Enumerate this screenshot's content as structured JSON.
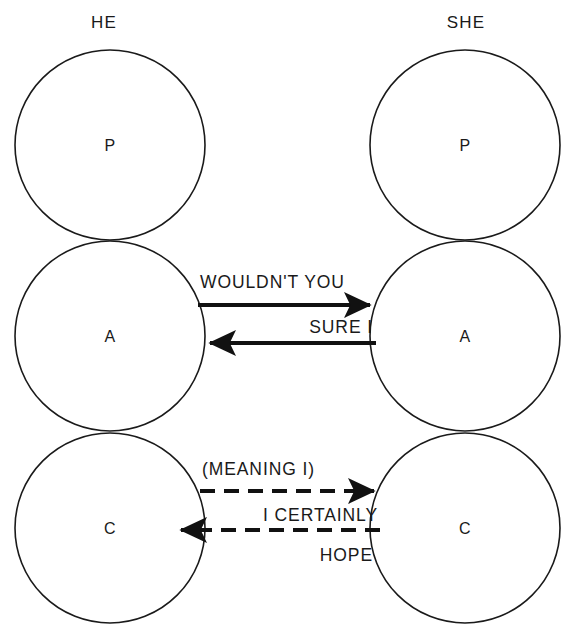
{
  "diagram": {
    "background_color": "#ffffff",
    "line_color": "#111111",
    "text_color": "#1a1a1a",
    "columns": [
      {
        "header": "HE",
        "header_x": 104,
        "header_y": 28,
        "center_x": 110,
        "ego_states": [
          {
            "letter": "P",
            "center_y": 145
          },
          {
            "letter": "A",
            "center_y": 336
          },
          {
            "letter": "C",
            "center_y": 528
          }
        ]
      },
      {
        "header": "SHE",
        "header_x": 466,
        "header_y": 28,
        "center_x": 465,
        "ego_states": [
          {
            "letter": "P",
            "center_y": 145
          },
          {
            "letter": "A",
            "center_y": 336
          },
          {
            "letter": "C",
            "center_y": 528
          }
        ]
      }
    ],
    "circle_radius": 95,
    "transactions": [
      {
        "label": "WOULDN'T YOU",
        "style": "solid",
        "direction": "right",
        "from": "he-adult",
        "to": "she-adult",
        "line_y": 305,
        "x_start": 198,
        "x_end": 374,
        "label_x": 200,
        "label_y": 288,
        "label_align": "start"
      },
      {
        "label": "SURE I",
        "style": "solid",
        "direction": "left",
        "from": "she-adult",
        "to": "he-adult",
        "line_y": 343,
        "x_start": 376,
        "x_end": 206,
        "label_x": 373,
        "label_y": 333,
        "label_align": "end"
      },
      {
        "label": "(MEANING I)",
        "style": "dashed",
        "direction": "right",
        "from": "he-child",
        "to": "she-child",
        "line_y": 491,
        "x_start": 200,
        "x_end": 378,
        "label_x": 202,
        "label_y": 475,
        "label_align": "start"
      },
      {
        "label": "I CERTAINLY",
        "style": "dashed",
        "direction": "left",
        "from": "she-child",
        "to": "he-child",
        "line_y": 530,
        "x_start": 380,
        "x_end": 177,
        "label_x": 378,
        "label_y": 521,
        "label_align": "end"
      },
      {
        "label": "HOPE",
        "style": "none",
        "direction": "none",
        "from": "she-child",
        "to": "he-child",
        "label_x": 373,
        "label_y": 561,
        "label_align": "end"
      }
    ]
  }
}
